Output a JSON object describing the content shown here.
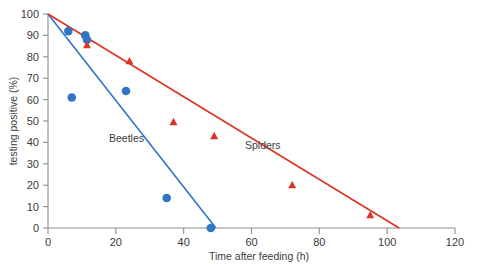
{
  "chart_data": {
    "type": "scatter",
    "title": "",
    "xlabel": "Time after feeding (h)",
    "ylabel": "testing positive (%)",
    "xlim": [
      0,
      120
    ],
    "ylim": [
      0,
      100
    ],
    "xticks": [
      0,
      20,
      40,
      60,
      80,
      100,
      120
    ],
    "yticks": [
      0,
      10,
      20,
      30,
      40,
      50,
      60,
      70,
      80,
      90,
      100
    ],
    "grid": false,
    "legend_position": "inline-annotations",
    "series": [
      {
        "name": "Beetles",
        "color": "#2E75C4",
        "marker": "circle",
        "points": [
          {
            "x": 6,
            "y": 92
          },
          {
            "x": 7,
            "y": 61
          },
          {
            "x": 11,
            "y": 90
          },
          {
            "x": 11.5,
            "y": 88
          },
          {
            "x": 23,
            "y": 64
          },
          {
            "x": 35,
            "y": 14
          },
          {
            "x": 48,
            "y": 0
          }
        ],
        "trendline": {
          "x1": 0,
          "y1": 100,
          "x2": 49.5,
          "y2": 0
        }
      },
      {
        "name": "Spiders",
        "color": "#DD3322",
        "marker": "triangle",
        "points": [
          {
            "x": 11.5,
            "y": 85.5
          },
          {
            "x": 24,
            "y": 78
          },
          {
            "x": 37,
            "y": 49.5
          },
          {
            "x": 49,
            "y": 43
          },
          {
            "x": 72,
            "y": 20
          },
          {
            "x": 95,
            "y": 6
          }
        ],
        "trendline": {
          "x1": 0,
          "y1": 100,
          "x2": 103.5,
          "y2": 0
        }
      }
    ],
    "annotations": [
      {
        "text": "Beetles",
        "x": 18,
        "y": 44
      },
      {
        "text": "Spiders",
        "x": 58,
        "y": 39
      }
    ]
  },
  "axes": {
    "x_tick_labels": [
      "0",
      "20",
      "40",
      "60",
      "80",
      "100",
      "120"
    ],
    "y_tick_labels": [
      "0",
      "10",
      "20",
      "30",
      "40",
      "50",
      "60",
      "70",
      "80",
      "90",
      "100"
    ],
    "x_title": "Time after feeding (h)",
    "y_title": "testing positive (%)"
  },
  "labels": {
    "beetles": "Beetles",
    "spiders": "Spiders"
  },
  "colors": {
    "beetles": "#2E75C4",
    "spiders": "#DD3322",
    "axis": "#8d8d8d",
    "text": "#3b3b3b",
    "background": "#ffffff"
  }
}
